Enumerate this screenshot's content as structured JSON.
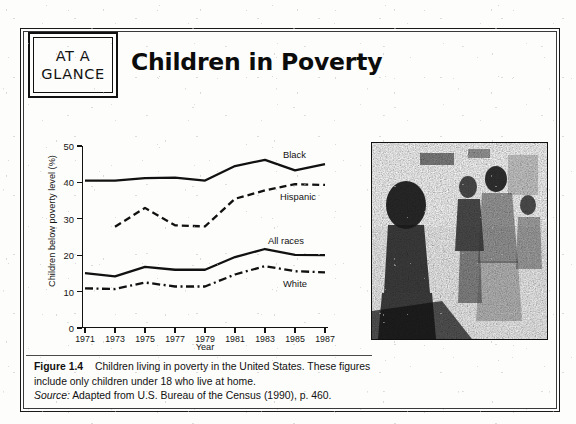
{
  "page": {
    "box_label_line1": "AT A",
    "box_label_line2": "GLANCE",
    "headline": "Children in Poverty"
  },
  "caption": {
    "figure_number": "Figure 1.4",
    "text": "Children living in poverty in the United States. These figures include only children under 18 who live at home.",
    "source_label": "Source:",
    "source_text": "Adapted from U.S. Bureau of the Census (1990), p. 460."
  },
  "photo": {
    "alt_name": "street-scene-photograph",
    "description": "Black-and-white halftone photograph of people walking on a city street"
  },
  "chart_data": {
    "type": "line",
    "title": "Children in Poverty",
    "xlabel": "Year",
    "ylabel": "Children below poverty level (%)",
    "x": [
      1971,
      1973,
      1975,
      1977,
      1979,
      1981,
      1983,
      1985,
      1987
    ],
    "xticklabels": [
      "1971",
      "1973",
      "1975",
      "1977",
      "1979",
      "1981",
      "1983",
      "1985",
      "1987"
    ],
    "yticklabels": [
      "0",
      "10",
      "20",
      "30",
      "40",
      "50"
    ],
    "yticks": [
      0,
      10,
      20,
      30,
      40,
      50
    ],
    "xlim": [
      1971,
      1987
    ],
    "ylim": [
      0,
      50
    ],
    "grid": false,
    "legend_position": "inline-right-of-line-ends",
    "series": [
      {
        "name": "Black",
        "values": [
          40.5,
          40.5,
          41.2,
          41.3,
          40.5,
          44.5,
          46.2,
          43.3,
          45.0
        ],
        "style": "solid",
        "label_x": 1984.2,
        "label_y": 47.5
      },
      {
        "name": "Hispanic",
        "values": [
          null,
          27.8,
          33.0,
          28.2,
          27.9,
          35.5,
          37.8,
          39.5,
          39.3
        ],
        "style": "dashed",
        "label_x": 1984.0,
        "label_y": 36.0
      },
      {
        "name": "All races",
        "values": [
          15.1,
          14.2,
          16.8,
          16.0,
          16.0,
          19.5,
          21.7,
          20.1,
          20.0
        ],
        "style": "solid",
        "label_x": 1983.2,
        "label_y": 23.8
      },
      {
        "name": "White",
        "values": [
          10.9,
          10.7,
          12.5,
          11.4,
          11.4,
          14.7,
          17.0,
          15.6,
          15.3
        ],
        "style": "dash-dot",
        "label_x": 1984.2,
        "label_y": 12.0
      }
    ]
  }
}
